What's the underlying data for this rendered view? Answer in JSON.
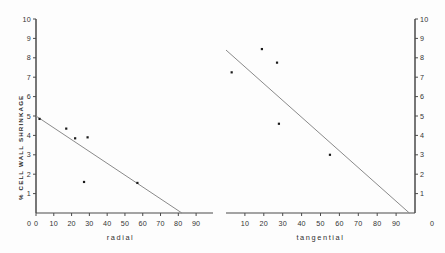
{
  "figure": {
    "background_color": "#fdfdfd",
    "axis_color": "#4a4a4a",
    "line_color": "#8a8a8a",
    "point_color": "#1a1a1a",
    "y_axis_label": "% CELL WALL SHRINKAGE"
  },
  "chart_data": [
    {
      "type": "scatter",
      "title": "",
      "xlabel": "radial",
      "ylabel": "% CELL WALL SHRINKAGE",
      "xlim": [
        0,
        95
      ],
      "ylim": [
        0,
        10
      ],
      "xticks": [
        0,
        10,
        20,
        30,
        40,
        50,
        60,
        70,
        80,
        90
      ],
      "yticks": [
        1,
        2,
        3,
        4,
        5,
        6,
        7,
        8,
        9,
        10
      ],
      "grid": false,
      "legend": "none",
      "points": [
        {
          "x": 2,
          "y": 4.85
        },
        {
          "x": 17,
          "y": 4.35
        },
        {
          "x": 22,
          "y": 3.85
        },
        {
          "x": 29,
          "y": 3.9
        },
        {
          "x": 27,
          "y": 1.6
        },
        {
          "x": 57,
          "y": 1.55
        }
      ],
      "trendline": {
        "x_start": 0,
        "y_start": 5.0,
        "x_end": 82,
        "y_end": 0.0
      }
    },
    {
      "type": "scatter",
      "title": "",
      "xlabel": "tangential",
      "ylabel": "% CELL WALL SHRINKAGE",
      "xlim": [
        0,
        100
      ],
      "ylim": [
        0,
        10
      ],
      "xticks": [
        10,
        20,
        30,
        40,
        50,
        60,
        70,
        80,
        90
      ],
      "yticks": [
        1,
        2,
        3,
        4,
        5,
        6,
        7,
        8,
        9,
        10
      ],
      "grid": false,
      "legend": "none",
      "points": [
        {
          "x": 3,
          "y": 7.25
        },
        {
          "x": 19,
          "y": 8.45
        },
        {
          "x": 27,
          "y": 7.75
        },
        {
          "x": 28,
          "y": 4.6
        },
        {
          "x": 55,
          "y": 3.0
        }
      ],
      "trendline": {
        "x_start": 0,
        "y_start": 8.4,
        "x_end": 97,
        "y_end": 0.0
      }
    }
  ]
}
